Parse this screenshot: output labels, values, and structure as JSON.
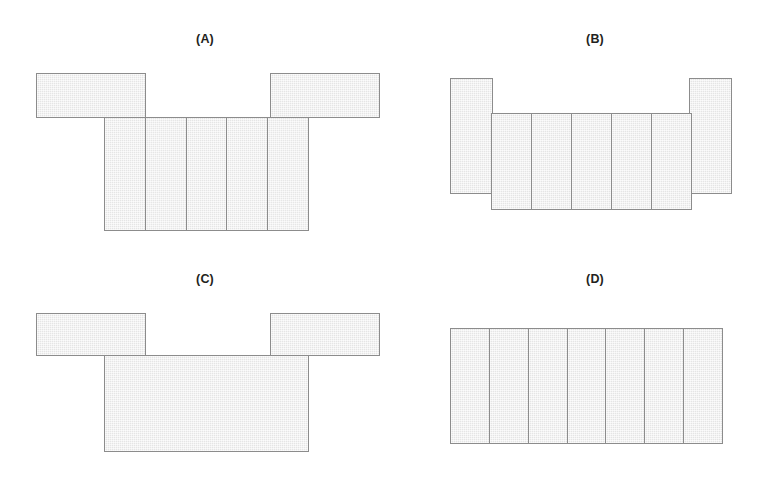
{
  "page": {
    "background_color": "#ffffff",
    "width": 761,
    "height": 491
  },
  "style": {
    "shape_fill": "#ebebeb",
    "shape_stroke": "#8c8c8c",
    "label_color": "#231f20"
  },
  "figures": [
    {
      "id": "A",
      "label": "(A)",
      "label_x": 205,
      "label_y": 32,
      "parts": [
        {
          "name": "top-left-bar",
          "kind": "rect",
          "x": 36,
          "y": 73,
          "w": 110,
          "h": 45,
          "cells": 1,
          "orientation": "horizontal"
        },
        {
          "name": "top-right-bar",
          "kind": "rect",
          "x": 270,
          "y": 73,
          "w": 110,
          "h": 45,
          "cells": 1,
          "orientation": "horizontal"
        },
        {
          "name": "bottom-row",
          "kind": "strip",
          "x": 104,
          "y": 117,
          "w": 205,
          "h": 114,
          "cells": 5,
          "orientation": "horizontal"
        }
      ]
    },
    {
      "id": "B",
      "label": "(B)",
      "label_x": 595,
      "label_y": 32,
      "parts": [
        {
          "name": "left-tall-bar",
          "kind": "rect",
          "x": 450,
          "y": 78,
          "w": 43,
          "h": 116,
          "cells": 1,
          "orientation": "vertical"
        },
        {
          "name": "right-tall-bar",
          "kind": "rect",
          "x": 689,
          "y": 78,
          "w": 43,
          "h": 116,
          "cells": 1,
          "orientation": "vertical"
        },
        {
          "name": "middle-row",
          "kind": "strip",
          "x": 491,
          "y": 113,
          "w": 201,
          "h": 97,
          "cells": 5,
          "orientation": "horizontal"
        }
      ]
    },
    {
      "id": "C",
      "label": "(C)",
      "label_x": 205,
      "label_y": 272,
      "parts": [
        {
          "name": "top-left-bar",
          "kind": "rect",
          "x": 36,
          "y": 313,
          "w": 110,
          "h": 43,
          "cells": 1,
          "orientation": "horizontal"
        },
        {
          "name": "top-right-bar",
          "kind": "rect",
          "x": 270,
          "y": 313,
          "w": 110,
          "h": 43,
          "cells": 1,
          "orientation": "horizontal"
        },
        {
          "name": "bottom-block",
          "kind": "rect",
          "x": 104,
          "y": 355,
          "w": 205,
          "h": 97,
          "cells": 1,
          "orientation": "horizontal"
        }
      ]
    },
    {
      "id": "D",
      "label": "(D)",
      "label_x": 595,
      "label_y": 272,
      "parts": [
        {
          "name": "single-row",
          "kind": "strip",
          "x": 450,
          "y": 328,
          "w": 273,
          "h": 116,
          "cells": 7,
          "orientation": "horizontal"
        }
      ]
    }
  ]
}
